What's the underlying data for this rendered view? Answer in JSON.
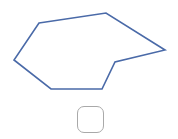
{
  "shape": {
    "type": "polygon",
    "points": [
      [
        39,
        23
      ],
      [
        106,
        13
      ],
      [
        165,
        50
      ],
      [
        115,
        62
      ],
      [
        102,
        89
      ],
      [
        51,
        89
      ],
      [
        14,
        60
      ]
    ],
    "stroke_color": "#4a6aa8",
    "stroke_width": 1.6,
    "fill": "none"
  },
  "checkbox": {
    "checked": false,
    "border_color": "#a9a9a9"
  }
}
